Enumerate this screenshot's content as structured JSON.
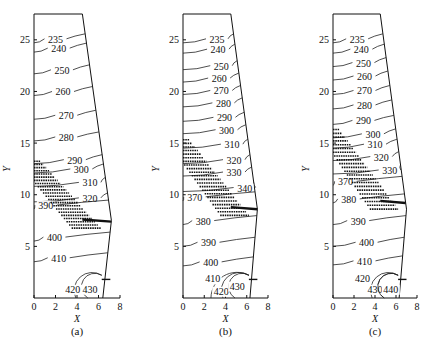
{
  "chart_data": [
    {
      "type": "contour",
      "panel_label": "(a)",
      "xlabel": "X",
      "ylabel": "Y",
      "xlim": [
        0,
        8
      ],
      "ylim": [
        0,
        27.5
      ],
      "xticks": [
        "0",
        "2",
        "4",
        "6",
        "8"
      ],
      "yticks": [
        "5",
        "10",
        "15",
        "20",
        "25"
      ],
      "domain_boundary": {
        "top_right_x": 4.5,
        "bulge_x": 7.2,
        "bulge_y": 7.5,
        "bottom_right_x": 6.4,
        "top_y": 27.5
      },
      "contour_levels": [
        235,
        240,
        250,
        260,
        270,
        280,
        290,
        300,
        310,
        320,
        390,
        400,
        410,
        420,
        430
      ],
      "contour_labels": [
        {
          "v": "235",
          "x": 2.0,
          "y": 25.0
        },
        {
          "v": "240",
          "x": 2.3,
          "y": 24.1
        },
        {
          "v": "250",
          "x": 2.6,
          "y": 22.0
        },
        {
          "v": "260",
          "x": 2.7,
          "y": 19.9
        },
        {
          "v": "270",
          "x": 3.0,
          "y": 17.6
        },
        {
          "v": "280",
          "x": 3.0,
          "y": 15.5
        },
        {
          "v": "290",
          "x": 3.8,
          "y": 13.3
        },
        {
          "v": "300",
          "x": 4.4,
          "y": 12.4
        },
        {
          "v": "310",
          "x": 5.2,
          "y": 11.1
        },
        {
          "v": "320",
          "x": 5.2,
          "y": 9.6
        },
        {
          "v": "390",
          "x": 1.1,
          "y": 8.9
        },
        {
          "v": "400",
          "x": 1.9,
          "y": 5.8
        },
        {
          "v": "410",
          "x": 2.3,
          "y": 3.8
        },
        {
          "v": "420",
          "x": 3.6,
          "y": 0.8
        },
        {
          "v": "430",
          "x": 5.2,
          "y": 0.8
        }
      ],
      "mushy_zone": "hatched band from Y≈13 at X=0 descending to Y≈7.5 at X≈7"
    },
    {
      "type": "contour",
      "panel_label": "(b)",
      "xlabel": "X",
      "ylabel": "Y",
      "xlim": [
        0,
        8
      ],
      "ylim": [
        0,
        27.5
      ],
      "xticks": [
        "0",
        "2",
        "4",
        "6",
        "8"
      ],
      "yticks": [
        "5",
        "10",
        "15",
        "20",
        "25"
      ],
      "contour_levels": [
        235,
        240,
        250,
        260,
        270,
        280,
        290,
        300,
        310,
        320,
        330,
        340,
        370,
        380,
        390,
        400,
        410,
        420,
        430
      ],
      "contour_labels": [
        {
          "v": "235",
          "x": 3.2,
          "y": 25.0
        },
        {
          "v": "240",
          "x": 3.3,
          "y": 24.0
        },
        {
          "v": "250",
          "x": 3.6,
          "y": 22.4
        },
        {
          "v": "260",
          "x": 3.4,
          "y": 21.2
        },
        {
          "v": "270",
          "x": 3.6,
          "y": 20.0
        },
        {
          "v": "280",
          "x": 3.8,
          "y": 18.8
        },
        {
          "v": "290",
          "x": 3.9,
          "y": 17.4
        },
        {
          "v": "300",
          "x": 4.1,
          "y": 16.2
        },
        {
          "v": "310",
          "x": 4.6,
          "y": 14.8
        },
        {
          "v": "320",
          "x": 4.8,
          "y": 13.3
        },
        {
          "v": "330",
          "x": 4.8,
          "y": 12.1
        },
        {
          "v": "340",
          "x": 5.8,
          "y": 10.6
        },
        {
          "v": "370",
          "x": 1.1,
          "y": 9.7
        },
        {
          "v": "380",
          "x": 1.9,
          "y": 7.4
        },
        {
          "v": "390",
          "x": 2.4,
          "y": 5.3
        },
        {
          "v": "400",
          "x": 2.6,
          "y": 3.4
        },
        {
          "v": "410",
          "x": 2.8,
          "y": 1.8
        },
        {
          "v": "420",
          "x": 3.6,
          "y": 0.6
        },
        {
          "v": "430",
          "x": 5.1,
          "y": 1.1
        }
      ],
      "mushy_zone": "hatched band from Y≈15.5 at X=0 descending to Y≈8.5 at X≈7"
    },
    {
      "type": "contour",
      "panel_label": "(c)",
      "xlabel": "X",
      "ylabel": "Y",
      "xlim": [
        0,
        8
      ],
      "ylim": [
        0,
        27.5
      ],
      "xticks": [
        "0",
        "2",
        "4",
        "6",
        "8"
      ],
      "yticks": [
        "5",
        "10",
        "15",
        "20",
        "25"
      ],
      "contour_levels": [
        235,
        240,
        250,
        260,
        270,
        280,
        290,
        300,
        310,
        320,
        330,
        370,
        380,
        390,
        400,
        410,
        420,
        430,
        440
      ],
      "contour_labels": [
        {
          "v": "235",
          "x": 2.3,
          "y": 25.0
        },
        {
          "v": "240",
          "x": 2.7,
          "y": 24.0
        },
        {
          "v": "250",
          "x": 2.9,
          "y": 22.7
        },
        {
          "v": "260",
          "x": 3.0,
          "y": 21.4
        },
        {
          "v": "270",
          "x": 3.0,
          "y": 20.0
        },
        {
          "v": "280",
          "x": 3.0,
          "y": 18.6
        },
        {
          "v": "290",
          "x": 2.9,
          "y": 17.1
        },
        {
          "v": "300",
          "x": 3.8,
          "y": 15.8
        },
        {
          "v": "310",
          "x": 4.0,
          "y": 14.8
        },
        {
          "v": "320",
          "x": 4.6,
          "y": 13.6
        },
        {
          "v": "330",
          "x": 5.4,
          "y": 12.3
        },
        {
          "v": "370",
          "x": 1.2,
          "y": 11.2
        },
        {
          "v": "380",
          "x": 1.5,
          "y": 9.5
        },
        {
          "v": "390",
          "x": 2.4,
          "y": 7.4
        },
        {
          "v": "400",
          "x": 3.2,
          "y": 5.3
        },
        {
          "v": "410",
          "x": 3.0,
          "y": 3.5
        },
        {
          "v": "420",
          "x": 2.8,
          "y": 1.8
        },
        {
          "v": "430",
          "x": 4.0,
          "y": 0.8
        },
        {
          "v": "440",
          "x": 5.5,
          "y": 0.8
        }
      ],
      "mushy_zone": "hatched band from Y≈16.5 at X=0 descending to Y≈9 at X≈7"
    }
  ],
  "panels": [
    {
      "caption": "(a)"
    },
    {
      "caption": "(b)"
    },
    {
      "caption": "(c)"
    }
  ],
  "axes": {
    "x_name": "X",
    "y_name": "Y"
  }
}
